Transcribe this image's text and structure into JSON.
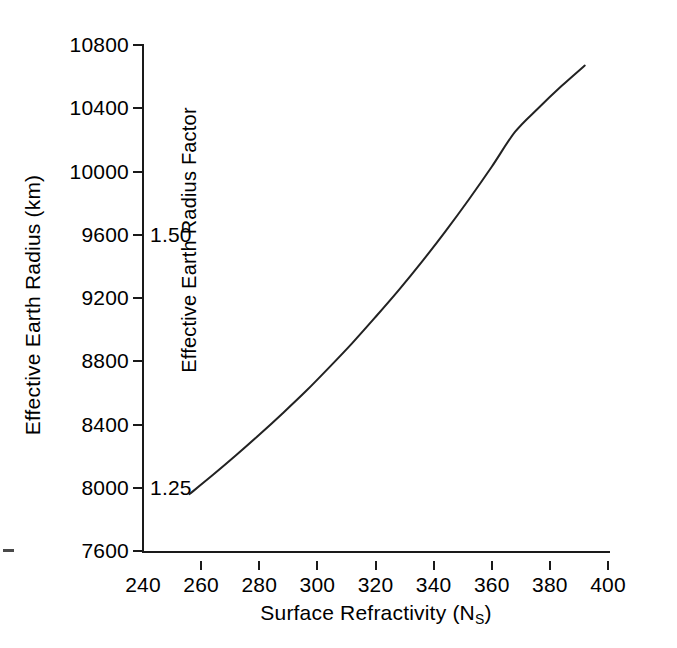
{
  "chart_data": {
    "type": "line",
    "title": "",
    "subtitle": "",
    "xlabel": "Surface Refractivity (NS)",
    "xlabel_base": "Surface Refractivity (N",
    "xlabel_sub": "S",
    "xlabel_tail": ")",
    "ylabel": "Effective Earth Radius (km)",
    "ylabel_secondary": "Effective Earth Radius Factor",
    "xlim": [
      240,
      400
    ],
    "ylim": [
      7600,
      10800
    ],
    "xticks": [
      240,
      260,
      280,
      300,
      320,
      340,
      360,
      380,
      400
    ],
    "xtick_labels": [
      "240",
      "260",
      "280",
      "300",
      "320",
      "340",
      "360",
      "380",
      "400"
    ],
    "yticks": [
      7600,
      8000,
      8400,
      8800,
      9200,
      9600,
      10000,
      10400,
      10800
    ],
    "ytick_labels": [
      "7600",
      "8000",
      "8400",
      "8800",
      "9200",
      "9600",
      "10000",
      "10400",
      "10800"
    ],
    "grid": false,
    "legend": false,
    "legend_position": "none",
    "annotations": [
      {
        "text": "1.25",
        "x": 240,
        "y": 8000,
        "note": "effective earth radius factor at 8000 km"
      },
      {
        "text": "1.50",
        "x": 240,
        "y": 9600,
        "note": "effective earth radius factor at 9600 km"
      }
    ],
    "series": [
      {
        "name": "Effective Earth Radius",
        "x": [
          256,
          264,
          272,
          280,
          288,
          296,
          304,
          312,
          320,
          328,
          336,
          344,
          352,
          360,
          368,
          376,
          384,
          392
        ],
        "values": [
          7960,
          8080,
          8205,
          8335,
          8470,
          8610,
          8760,
          8915,
          9080,
          9250,
          9430,
          9620,
          9820,
          10030,
          10250,
          10400,
          10540,
          10670
        ]
      }
    ]
  },
  "axes": {
    "x_title": "Surface Refractivity (N",
    "x_title_sub": "S",
    "x_title_end": ")",
    "y_title": "Effective Earth Radius (km)",
    "y_title_inner": "Effective Earth Radius Factor"
  },
  "colors": {
    "curve": "#222222",
    "axis": "#1a1a1a",
    "background": "#ffffff",
    "text": "#000000"
  }
}
